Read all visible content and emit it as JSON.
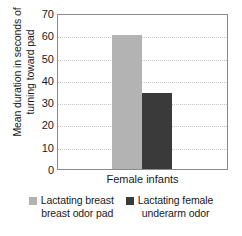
{
  "chart_data": {
    "type": "bar",
    "title": "",
    "xlabel": "Female infants",
    "ylabel": "Mean duration in seconds of turning toward pad",
    "ylabel_lines": [
      "Mean duration in seconds of",
      "turning toward pad"
    ],
    "categories": [
      "Female infants"
    ],
    "ylim": [
      0,
      70
    ],
    "yticks": [
      70,
      60,
      50,
      40,
      30,
      20,
      10,
      0
    ],
    "grid": true,
    "legend_position": "bottom",
    "series": [
      {
        "name": "Lactating breast breast odor pad",
        "name_lines": [
          "Lactating breast",
          "breast odor pad"
        ],
        "values": [
          60
        ],
        "color": "#b3b3b3"
      },
      {
        "name": "Lactating female underarm odor",
        "name_lines": [
          "Lactating female",
          "underarm odor"
        ],
        "values": [
          34
        ],
        "color": "#3a3a3a"
      }
    ]
  },
  "colors": {
    "series_light": "#b3b3b3",
    "series_dark": "#3a3a3a",
    "frame": "#8a8a8a",
    "gridline": "#c6c6c6",
    "text": "#1a1a1a",
    "background": "#ffffff"
  }
}
